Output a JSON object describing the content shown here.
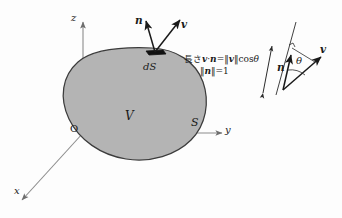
{
  "figure": {
    "background_color": "#fdfdfd",
    "blob_fill": "#b4b4b4",
    "blob_stroke": "#3c3c3c",
    "axis_color": "#8c8c8c",
    "ink_color": "#1a1a1a"
  },
  "axes": {
    "z_label": "z",
    "y_label": "y",
    "x_label": "x",
    "origin_label": "O"
  },
  "body": {
    "volume_label": "V",
    "surface_label": "S",
    "element_label": "dS"
  },
  "vectors": {
    "normal_label": "n",
    "velocity_label": "v"
  },
  "annotation": {
    "line1_prefix": "長さ",
    "line1_dot_left": "v",
    "line1_dot": "·",
    "line1_dot_right": "n",
    "line1_equals": "=",
    "line1_norm_open": "‖",
    "line1_norm_var": "v",
    "line1_norm_close": "‖",
    "line1_cos": "cos",
    "line1_theta": "θ",
    "line2_norm_open": "‖",
    "line2_norm_var": "n",
    "line2_norm_close": "‖",
    "line2_equals": "=",
    "line2_value": "1"
  },
  "inset": {
    "normal_label": "n",
    "velocity_label": "v",
    "angle_label": "θ"
  }
}
